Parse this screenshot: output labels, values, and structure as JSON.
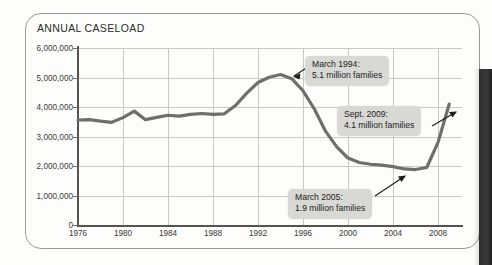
{
  "figure": {
    "title": "ANNUAL CASELOAD"
  },
  "chart_data": {
    "type": "line",
    "title": "ANNUAL CASELOAD",
    "xlabel": "",
    "ylabel": "",
    "xlim": [
      1976,
      2010
    ],
    "ylim": [
      0,
      6000000
    ],
    "grid": true,
    "legend": "none",
    "y_ticks": [
      "0",
      "1,000,000",
      "2,000,000",
      "3,000,000",
      "4,000,000",
      "5,000,000",
      "6,000,000"
    ],
    "y_tick_values": [
      0,
      1000000,
      2000000,
      3000000,
      4000000,
      5000000,
      6000000
    ],
    "x_ticks": [
      "1976",
      "1980",
      "1984",
      "1988",
      "1992",
      "1996",
      "2000",
      "2004",
      "2008"
    ],
    "x_tick_values": [
      1976,
      1980,
      1984,
      1988,
      1992,
      1996,
      2000,
      2004,
      2008
    ],
    "series": [
      {
        "name": "Annual caseload (families)",
        "color": "#6e6e6e",
        "x": [
          1976,
          1977,
          1978,
          1979,
          1980,
          1981,
          1982,
          1983,
          1984,
          1985,
          1986,
          1987,
          1988,
          1989,
          1990,
          1991,
          1992,
          1993,
          1994,
          1995,
          1996,
          1997,
          1998,
          1999,
          2000,
          2001,
          2002,
          2003,
          2004,
          2005,
          2006,
          2007,
          2008,
          2009
        ],
        "values": [
          3560000,
          3570000,
          3520000,
          3480000,
          3640000,
          3860000,
          3570000,
          3650000,
          3720000,
          3690000,
          3750000,
          3780000,
          3750000,
          3770000,
          4050000,
          4470000,
          4830000,
          5010000,
          5100000,
          4960000,
          4550000,
          3940000,
          3180000,
          2650000,
          2270000,
          2120000,
          2060000,
          2030000,
          1980000,
          1900000,
          1880000,
          1950000,
          2800000,
          4100000
        ],
        "annotations": [
          {
            "id": "peak-1994",
            "label_line1": "March 1994:",
            "label_line2": "5.1 million families",
            "x": 1994,
            "y": 5100000
          },
          {
            "id": "trough-2005",
            "label_line1": "March 2005:",
            "label_line2": "1.9 million families",
            "x": 2005,
            "y": 1900000
          },
          {
            "id": "rise-2009",
            "label_line1": "Sept. 2009:",
            "label_line2": "4.1 million families",
            "x": 2009,
            "y": 4100000
          }
        ]
      }
    ]
  },
  "annotations": {
    "peak_1994": {
      "line1": "March 1994:",
      "line2": "5.1 million families"
    },
    "sept_2009": {
      "line1": "Sept. 2009:",
      "line2": "4.1 million families"
    },
    "march_2005": {
      "line1": "March 2005:",
      "line2": "1.9 million families"
    }
  },
  "colors": {
    "series_line": "#6e6e6e",
    "gridline": "#c9c9c4",
    "axis": "#55544f",
    "callout_bg": "#d8d8d4",
    "frame_border": "#9a9a95",
    "page_bg": "#fdfdfb"
  }
}
